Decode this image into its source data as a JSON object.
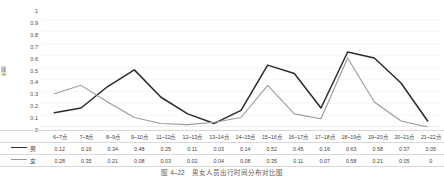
{
  "chart_data": {
    "type": "line",
    "title": "",
    "xlabel": "",
    "ylabel": "比例",
    "ylim": [
      0,
      1
    ],
    "ytick_step": 0.1,
    "yticks": [
      "1",
      "0.9",
      "0.8",
      "0.7",
      "0.6",
      "0.5",
      "0.4",
      "0.3",
      "0.2",
      "0.1",
      "0"
    ],
    "grid": true,
    "grid_axis": "y",
    "legend_position": "table-left",
    "categories": [
      "6~7点",
      "7~8点",
      "8~9点",
      "9~10点",
      "11~12点",
      "12~13点",
      "13~14点",
      "14~15点",
      "15~16点",
      "16~17点",
      "17~18点",
      "18~19点",
      "19~20点",
      "20~21点",
      "21~22点"
    ],
    "series": [
      {
        "name": "男",
        "color": "#2b2b2b",
        "values": [
          0.12,
          0.16,
          0.34,
          0.48,
          0.25,
          0.11,
          0.03,
          0.14,
          0.52,
          0.45,
          0.16,
          0.63,
          0.58,
          0.37,
          0.05
        ]
      },
      {
        "name": "女",
        "color": "#9a9a9a",
        "values": [
          0.28,
          0.35,
          0.21,
          0.08,
          0.03,
          0.02,
          0.04,
          0.08,
          0.35,
          0.11,
          0.07,
          0.58,
          0.21,
          0.05,
          0
        ]
      }
    ]
  },
  "table": {
    "header_corner": "",
    "columns": [
      "6~7点",
      "7~8点",
      "8~9点",
      "9~10点",
      "11~12点",
      "12~13点",
      "13~14点",
      "14~15点",
      "15~16点",
      "16~17点",
      "17~18点",
      "18~19点",
      "19~20点",
      "20~21点",
      "21~22点"
    ],
    "rows": [
      {
        "label": "男",
        "values": [
          "0.12",
          "0.16",
          "0.34",
          "0.48",
          "0.25",
          "0.11",
          "0.03",
          "0.14",
          "0.52",
          "0.45",
          "0.16",
          "0.63",
          "0.58",
          "0.37",
          "0.05"
        ]
      },
      {
        "label": "女",
        "values": [
          "0.28",
          "0.35",
          "0.21",
          "0.08",
          "0.03",
          "0.02",
          "0.04",
          "0.08",
          "0.35",
          "0.11",
          "0.07",
          "0.58",
          "0.21",
          "0.05",
          "0"
        ]
      }
    ]
  },
  "caption": {
    "text": "图 4–22　男女人员出行时间分布对比图"
  }
}
